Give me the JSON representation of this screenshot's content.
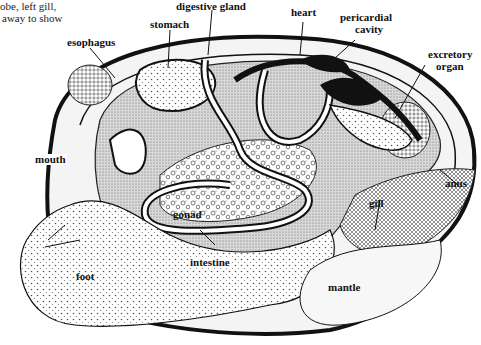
{
  "caption": {
    "lines": [
      "obe, left gill,",
      " away to show"
    ]
  },
  "labels": {
    "esophagus": "esophagus",
    "stomach": "stomach",
    "digestive_gland": "digestive gland",
    "heart": "heart",
    "pericardial_cavity_1": "pericardial",
    "pericardial_cavity_2": "cavity",
    "excretory_organ_1": "excretory",
    "excretory_organ_2": "organ",
    "mouth": "mouth",
    "anus": "anus",
    "gill": "gill",
    "gonad": "gonad",
    "intestine": "intestine",
    "foot": "foot",
    "mantle": "mantle"
  },
  "colors": {
    "ink": "#111111",
    "shade": "#bdbdbd",
    "light": "#e6e6e6",
    "paper": "#ffffff"
  }
}
